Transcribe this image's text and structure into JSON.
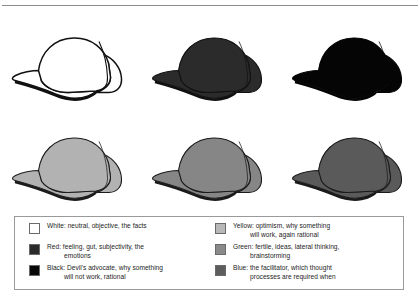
{
  "figure": {
    "top_rule": "horizontal-rule"
  },
  "caps": [
    {
      "id": "cap-white",
      "label": "White",
      "fill": "#ffffff",
      "stroke": "#111111",
      "row": 0,
      "col": 0,
      "style": "outline"
    },
    {
      "id": "cap-red",
      "label": "Red",
      "fill": "#2b2b2b",
      "stroke": "#111111",
      "row": 0,
      "col": 1,
      "style": "solid"
    },
    {
      "id": "cap-black",
      "label": "Black",
      "fill": "#050505",
      "stroke": "#050505",
      "row": 0,
      "col": 2,
      "style": "solid"
    },
    {
      "id": "cap-yellow",
      "label": "Yellow",
      "fill": "#b2b2b2",
      "stroke": "#1b1b1b",
      "row": 1,
      "col": 0,
      "style": "solid"
    },
    {
      "id": "cap-green",
      "label": "Green",
      "fill": "#868686",
      "stroke": "#1b1b1b",
      "row": 1,
      "col": 1,
      "style": "solid"
    },
    {
      "id": "cap-blue",
      "label": "Blue",
      "fill": "#5a5a5a",
      "stroke": "#1b1b1b",
      "row": 1,
      "col": 2,
      "style": "solid"
    }
  ],
  "legend": {
    "left_column": [
      {
        "swatch_name": "swatch-white",
        "swatch_color": "#ffffff",
        "line1": "White: neutral, objective, the facts",
        "line2": ""
      },
      {
        "swatch_name": "swatch-red",
        "swatch_color": "#2b2b2b",
        "line1": "Red: feeling, gut, subjectivity, the",
        "line2": "emotions"
      },
      {
        "swatch_name": "swatch-black",
        "swatch_color": "#080808",
        "line1": "Black: Devil's advocate, why something",
        "line2": "will not work, rational"
      }
    ],
    "right_column": [
      {
        "swatch_name": "swatch-yellow",
        "swatch_color": "#b8b8b8",
        "line1": "Yellow: optimism, why something",
        "line2": "will work, again rational"
      },
      {
        "swatch_name": "swatch-green",
        "swatch_color": "#8a8a8a",
        "line1": "Green: fertile, ideas, lateral thinking,",
        "line2": "brainstorming"
      },
      {
        "swatch_name": "swatch-blue",
        "swatch_color": "#5d5d5d",
        "line1": "Blue: the facilitator, which thought",
        "line2": "processes are required when"
      }
    ]
  }
}
